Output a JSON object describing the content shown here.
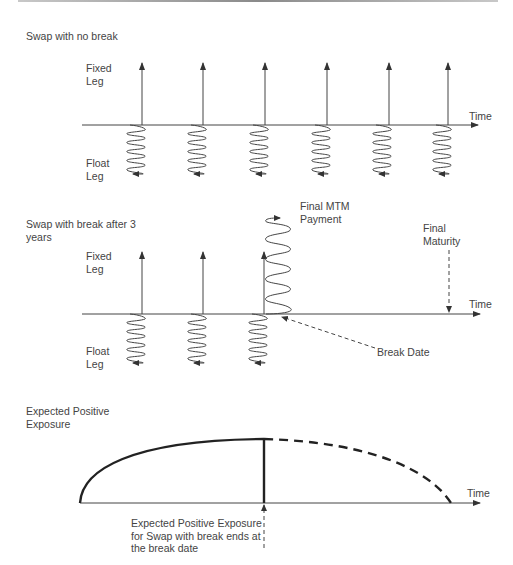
{
  "panels": [
    {
      "id": "no-break",
      "title": "Swap with no break",
      "fixed_leg_label": "Fixed\nLeg",
      "float_leg_label": "Float\nLeg",
      "axis_label": "Time",
      "fixed_payment_x": [
        142,
        203,
        265,
        327,
        389,
        448
      ]
    },
    {
      "id": "with-break",
      "title": "Swap with break after 3\nyears",
      "fixed_leg_label": "Fixed\nLeg",
      "float_leg_label": "Float\nLeg",
      "axis_label": "Time",
      "fixed_payment_x": [
        142,
        203,
        264
      ],
      "final_mtm_label": "Final MTM\nPayment",
      "final_maturity_label": "Final\nMaturity",
      "break_date_label": "Break Date"
    },
    {
      "id": "epe",
      "title": "Expected Positive\nExposure",
      "axis_label": "Time",
      "annotation": "Expected Positive Exposure\nfor Swap with break ends at\nthe break date"
    }
  ],
  "colors": {
    "line": "#3c3c3c",
    "text": "#444444"
  }
}
